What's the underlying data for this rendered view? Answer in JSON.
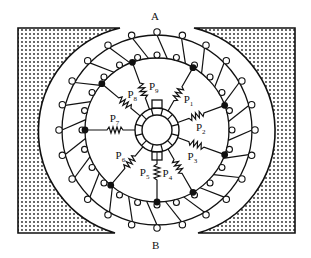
{
  "figure": {
    "type": "armature winding with equalizer resistances diagram",
    "pole_labels": {
      "top": "A",
      "bottom": "B"
    },
    "resistors": [
      {
        "label": "P",
        "sub": "1",
        "angle_deg": -60
      },
      {
        "label": "P",
        "sub": "2",
        "angle_deg": -20
      },
      {
        "label": "P",
        "sub": "3",
        "angle_deg": 20
      },
      {
        "label": "P",
        "sub": "4",
        "angle_deg": 60
      },
      {
        "label": "P",
        "sub": "5",
        "angle_deg": 90
      },
      {
        "label": "P",
        "sub": "6",
        "angle_deg": 130
      },
      {
        "label": "P",
        "sub": "7",
        "angle_deg": 180
      },
      {
        "label": "P",
        "sub": "8",
        "angle_deg": 220
      },
      {
        "label": "P",
        "sub": "9",
        "angle_deg": 250
      }
    ],
    "stator_fill": "dotted",
    "coil_count": 24,
    "colors": {
      "ink": "#111111",
      "background": "#ffffff"
    }
  }
}
